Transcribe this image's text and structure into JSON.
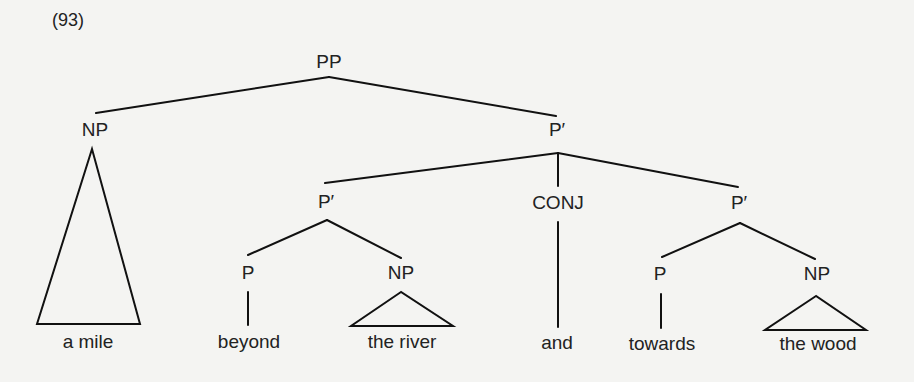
{
  "example_number": "(93)",
  "nodes": {
    "root": {
      "label": "PP",
      "x": 329,
      "y": 51
    },
    "spec_np": {
      "label": "NP",
      "x": 95,
      "y": 119
    },
    "pbar_top": {
      "label": "P′",
      "x": 557,
      "y": 119
    },
    "pbar_left": {
      "label": "P′",
      "x": 326,
      "y": 191
    },
    "conj": {
      "label": "CONJ",
      "x": 558,
      "y": 192
    },
    "pbar_right": {
      "label": "P′",
      "x": 739,
      "y": 192
    },
    "p_left": {
      "label": "P",
      "x": 248,
      "y": 262
    },
    "np_left": {
      "label": "NP",
      "x": 401,
      "y": 262
    },
    "p_right": {
      "label": "P",
      "x": 660,
      "y": 263
    },
    "np_right": {
      "label": "NP",
      "x": 817,
      "y": 263
    }
  },
  "leaves": {
    "a_mile": {
      "text": "a mile",
      "x": 88,
      "y": 331
    },
    "beyond": {
      "text": "beyond",
      "x": 249,
      "y": 331
    },
    "the_river": {
      "text": "the river",
      "x": 402,
      "y": 331
    },
    "and": {
      "text": "and",
      "x": 557,
      "y": 332
    },
    "towards": {
      "text": "towards",
      "x": 662,
      "y": 333
    },
    "the_wood": {
      "text": "the wood",
      "x": 818,
      "y": 333
    }
  },
  "edges": [
    {
      "from": "PP",
      "to": "NP",
      "x1": 329,
      "y1": 77,
      "x2": 96,
      "y2": 113
    },
    {
      "from": "PP",
      "to": "P′",
      "x1": 329,
      "y1": 77,
      "x2": 556,
      "y2": 116
    },
    {
      "from": "P′",
      "to": "P′(left)",
      "x1": 558,
      "y1": 153,
      "x2": 325,
      "y2": 183
    },
    {
      "from": "P′",
      "to": "CONJ",
      "x1": 558,
      "y1": 153,
      "x2": 558,
      "y2": 186
    },
    {
      "from": "P′",
      "to": "P′(right)",
      "x1": 558,
      "y1": 153,
      "x2": 738,
      "y2": 187
    },
    {
      "from": "P′(left)",
      "to": "P",
      "x1": 327,
      "y1": 220,
      "x2": 248,
      "y2": 255
    },
    {
      "from": "P′(left)",
      "to": "NP",
      "x1": 327,
      "y1": 220,
      "x2": 401,
      "y2": 258
    },
    {
      "from": "P",
      "to": "beyond",
      "x1": 248,
      "y1": 292,
      "x2": 248,
      "y2": 325
    },
    {
      "from": "CONJ",
      "to": "and",
      "x1": 558,
      "y1": 222,
      "x2": 558,
      "y2": 327
    },
    {
      "from": "P′(right)",
      "to": "P",
      "x1": 740,
      "y1": 223,
      "x2": 662,
      "y2": 257
    },
    {
      "from": "P′(right)",
      "to": "NP",
      "x1": 740,
      "y1": 223,
      "x2": 815,
      "y2": 259
    },
    {
      "from": "P",
      "to": "towards",
      "x1": 661,
      "y1": 294,
      "x2": 661,
      "y2": 328
    }
  ],
  "triangles": [
    {
      "node": "NP",
      "covers": "a mile",
      "points": "92,149 37,324 140,324"
    },
    {
      "node": "NP",
      "covers": "the river",
      "points": "401,292 351,326 453,326"
    },
    {
      "node": "NP",
      "covers": "the wood",
      "points": "816,296 765,330 866,330"
    }
  ]
}
